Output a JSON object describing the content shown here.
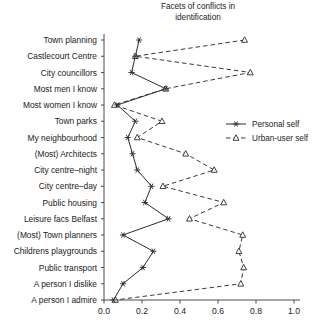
{
  "chart_data": {
    "type": "line",
    "title": "Facets of conflicts in identification",
    "title_line1": "Facets of conflicts in",
    "title_line2": "identification",
    "orientation": "horizontal",
    "xlabel": "",
    "ylabel": "",
    "xlim": [
      0.0,
      1.0
    ],
    "xticks": [
      0.0,
      0.2,
      0.4,
      0.6,
      0.8,
      1.0
    ],
    "xticklabels": [
      "0.0",
      "0.2",
      "0.4",
      "0.6",
      "0.8",
      "1.0"
    ],
    "grid": false,
    "legend_position": "right-middle",
    "categories": [
      "Town planning",
      "Castlecourt Centre",
      "City councillors",
      "Most men I know",
      "Most women I know",
      "Town parks",
      "My neighbourhood",
      "(Most) Architects",
      "City centre–night",
      "City centre–day",
      "Public housing",
      "Leisure facs Belfast",
      "(Most) Town planners",
      "Childrens playgrounds",
      "Public transport",
      "A person I dislike",
      "A person I admire"
    ],
    "series": [
      {
        "name": "Personal self",
        "marker": "star",
        "linestyle": "solid",
        "color": "#2b2b2b",
        "values": [
          0.185,
          0.165,
          0.145,
          0.325,
          0.07,
          0.165,
          0.125,
          0.15,
          0.175,
          0.25,
          0.215,
          0.34,
          0.1,
          0.26,
          0.205,
          0.1,
          0.05
        ]
      },
      {
        "name": "Urban-user self",
        "marker": "triangle",
        "linestyle": "dashed",
        "color": "#3a3a3a",
        "values": [
          0.74,
          0.165,
          0.77,
          0.325,
          0.055,
          0.305,
          0.175,
          0.43,
          0.58,
          0.31,
          0.63,
          0.45,
          0.73,
          0.71,
          0.735,
          0.72,
          0.06
        ]
      }
    ]
  },
  "legend": {
    "items": [
      {
        "label": "Personal self",
        "marker": "star",
        "linestyle": "solid"
      },
      {
        "label": "Urban-user self",
        "marker": "triangle",
        "linestyle": "dashed"
      }
    ]
  },
  "colors": {
    "axis": "#4a4a4a",
    "personal": "#2b2b2b",
    "urban": "#3a3a3a",
    "text": "#1a1a1a",
    "background": "#ffffff"
  }
}
